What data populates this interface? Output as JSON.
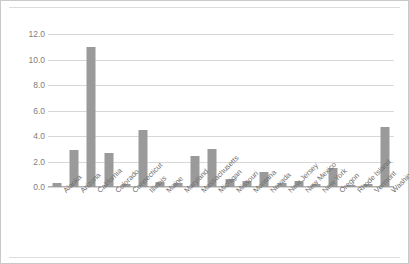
{
  "chart_data": {
    "type": "bar",
    "title": "",
    "subtitle": "",
    "xlabel": "",
    "ylabel": "",
    "ylim": [
      0.0,
      12.0
    ],
    "ytick_step": 2.0,
    "ytick_labels": [
      "0.0",
      "2.0",
      "4.0",
      "6.0",
      "8.0",
      "10.0",
      "12.0"
    ],
    "ytick_values": [
      0.0,
      2.0,
      4.0,
      6.0,
      8.0,
      10.0,
      12.0
    ],
    "grid": true,
    "legend": false,
    "legend_position": "none",
    "bar_color": "#9a9a9a",
    "categories": [
      "Alaska",
      "Arizona",
      "California",
      "Colorado",
      "Connecticut",
      "Illinois",
      "Maine",
      "Maryland",
      "Massachusetts",
      "Michigan",
      "Missouri",
      "Montana",
      "Nevada",
      "New Jersey",
      "New Mexico",
      "New York",
      "Oregon",
      "Rhode Island",
      "Vermont",
      "Washington"
    ],
    "values": [
      0.3,
      2.9,
      11.0,
      2.7,
      0.2,
      4.5,
      0.4,
      0.35,
      2.45,
      3.0,
      0.6,
      0.45,
      1.15,
      0.35,
      0.5,
      0.2,
      1.5,
      0.15,
      0.2,
      4.7
    ]
  },
  "figure": {
    "background_color": "#ffffff",
    "border_color": "#c9c9c9",
    "gridline_color": "#d8d8d8",
    "tick_label_color": "#808080"
  }
}
